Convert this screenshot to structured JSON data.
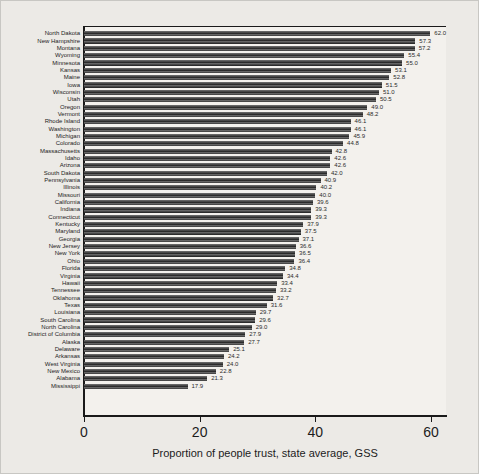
{
  "figure": {
    "background": "#eceae6",
    "plot_background": "#f3f1ed"
  },
  "chart_data": {
    "type": "bar",
    "orientation": "horizontal",
    "title": "",
    "xlabel": "Proportion of people trust, state average, GSS",
    "ylabel": "",
    "grid": "off",
    "legend": "none",
    "x_ticks": [
      0,
      20,
      40,
      60
    ],
    "xlim": [
      0,
      62.6
    ],
    "bar_color": "#3a3a3a",
    "categories": [
      "North Dakota",
      "New Hampshire",
      "Montana",
      "Wyoming",
      "Minnesota",
      "Kansas",
      "Maine",
      "Iowa",
      "Wisconsin",
      "Utah",
      "Oregon",
      "Vermont",
      "Rhode Island",
      "Washington",
      "Michigan",
      "Colorado",
      "Massachusetts",
      "Idaho",
      "Arizona",
      "South Dakota",
      "Pennsylvania",
      "Illinois",
      "Missouri",
      "California",
      "Indiana",
      "Connecticut",
      "Kentucky",
      "Maryland",
      "Georgia",
      "New Jersey",
      "New York",
      "Ohio",
      "Florida",
      "Virginia",
      "Hawaii",
      "Tennessee",
      "Oklahoma",
      "Texas",
      "Louisiana",
      "South Carolina",
      "North Carolina",
      "District of Columbia",
      "Alaska",
      "Delaware",
      "Arkansas",
      "West Virginia",
      "New Mexico",
      "Alabama",
      "Mississippi"
    ],
    "values": [
      62.0,
      57.3,
      57.2,
      55.4,
      55.0,
      53.1,
      52.8,
      51.5,
      51.0,
      50.5,
      49.0,
      48.2,
      46.1,
      46.1,
      45.9,
      44.8,
      42.8,
      42.6,
      42.6,
      42.0,
      40.9,
      40.2,
      40.0,
      39.6,
      39.3,
      39.3,
      37.9,
      37.5,
      37.1,
      36.6,
      36.5,
      36.4,
      34.8,
      34.4,
      33.4,
      33.2,
      32.7,
      31.6,
      29.7,
      29.6,
      29.0,
      27.9,
      27.7,
      25.1,
      24.2,
      24.0,
      22.8,
      21.3,
      17.9
    ]
  }
}
